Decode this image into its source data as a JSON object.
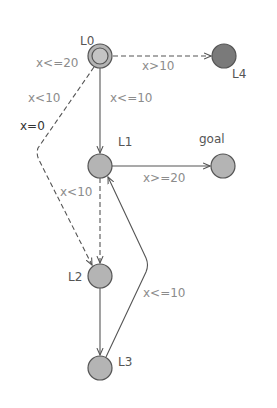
{
  "diagram": {
    "type": "timed-automaton",
    "colors": {
      "location_fill": "#b4b4b4",
      "sink_fill": "#7a7a7a",
      "stroke": "#555555",
      "guard_text": "#8c8c8c",
      "assign_text": "#333333"
    },
    "locations": [
      {
        "id": "L0",
        "label": "L0",
        "initial": true
      },
      {
        "id": "L1",
        "label": "L1"
      },
      {
        "id": "L2",
        "label": "L2"
      },
      {
        "id": "L3",
        "label": "L3"
      },
      {
        "id": "L4",
        "label": "L4"
      },
      {
        "id": "goal",
        "label": "goal"
      }
    ],
    "invariants": {
      "L0": "x<=20"
    },
    "edges": [
      {
        "from": "L0",
        "to": "L4",
        "guard": "x>10",
        "style": "dashed"
      },
      {
        "from": "L0",
        "to": "L1",
        "guard": "x<=10",
        "style": "solid"
      },
      {
        "from": "L0",
        "to": "L2",
        "guard": "x<10",
        "assign": "x=0",
        "style": "dashed"
      },
      {
        "from": "L1",
        "to": "goal",
        "guard": "x>=20",
        "style": "solid"
      },
      {
        "from": "L1",
        "to": "L2",
        "guard": "x<10",
        "style": "dashed"
      },
      {
        "from": "L2",
        "to": "L3",
        "guard": "",
        "style": "solid"
      },
      {
        "from": "L3",
        "to": "L1",
        "guard": "x<=10",
        "style": "solid"
      }
    ]
  }
}
